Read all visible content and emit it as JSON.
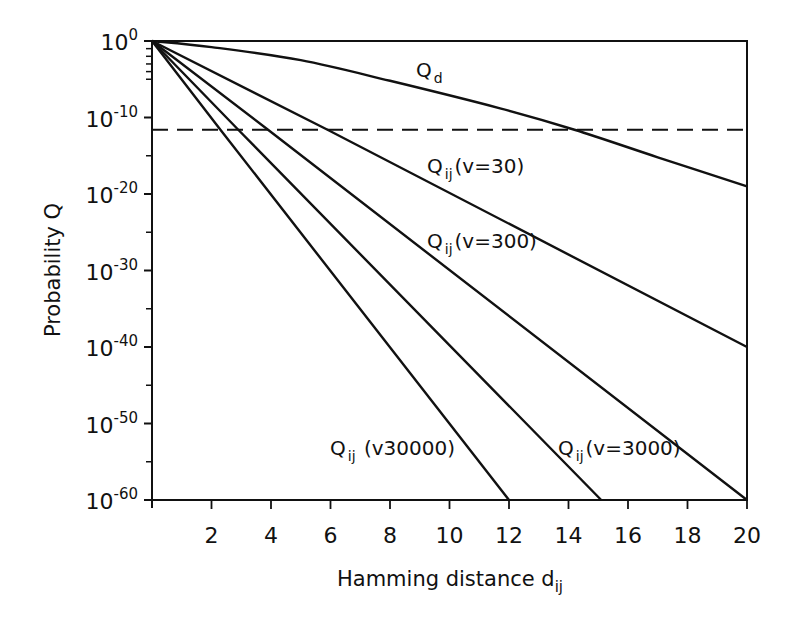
{
  "chart_data": {
    "type": "line",
    "title": "",
    "xlabel": "Hamming distance d_ij",
    "xlabel_main": "Hamming  distance  d",
    "xlabel_sub": "ij",
    "ylabel": "Probability  Q",
    "x_scale": "linear",
    "y_scale": "log",
    "xlim": [
      0,
      20
    ],
    "ylim_exponent": [
      -60,
      0
    ],
    "x_ticks": [
      2,
      4,
      6,
      8,
      10,
      12,
      14,
      16,
      18,
      20
    ],
    "y_ticks": [
      {
        "exp": 0,
        "label_base": "10",
        "label_exp": "0"
      },
      {
        "exp": -10,
        "label_base": "10",
        "label_exp": "-10"
      },
      {
        "exp": -20,
        "label_base": "10",
        "label_exp": "-20"
      },
      {
        "exp": -30,
        "label_base": "10",
        "label_exp": "-30"
      },
      {
        "exp": -40,
        "label_base": "10",
        "label_exp": "-40"
      },
      {
        "exp": -50,
        "label_base": "10",
        "label_exp": "-50"
      },
      {
        "exp": -60,
        "label_base": "10",
        "label_exp": "-60"
      }
    ],
    "y_minor_ticks_exp": [
      -1,
      -2,
      -3,
      -4,
      -5,
      -15,
      -25,
      -35,
      -45,
      -55
    ],
    "grid": false,
    "legend": "inline labels",
    "threshold_line": {
      "style": "dashed",
      "y_exponent": -11.6
    },
    "series": [
      {
        "name": "Q_d",
        "label_main": "Q",
        "label_sub": "d",
        "label_rest": "",
        "points": [
          [
            0,
            0
          ],
          [
            2,
            -0.8
          ],
          [
            5,
            -2.5
          ],
          [
            8,
            -5.2
          ],
          [
            11.7,
            -8.8
          ],
          [
            14.2,
            -11.6
          ],
          [
            17,
            -15.2
          ],
          [
            20,
            -19
          ]
        ]
      },
      {
        "name": "Q_ij (v=30)",
        "label_main": "Q",
        "label_sub": "ij",
        "label_rest": "(v=30)",
        "points": [
          [
            0,
            0
          ],
          [
            5.9,
            -11.6
          ],
          [
            20,
            -40
          ]
        ]
      },
      {
        "name": "Q_ij (v=300)",
        "label_main": "Q",
        "label_sub": "ij",
        "label_rest": "(v=300)",
        "points": [
          [
            0,
            0
          ],
          [
            3.9,
            -11.6
          ],
          [
            20,
            -60
          ]
        ]
      },
      {
        "name": "Q_ij (v=3000)",
        "label_main": "Q",
        "label_sub": "ij",
        "label_rest": "(v=3000)",
        "points": [
          [
            0,
            0
          ],
          [
            2.9,
            -11.6
          ],
          [
            15.1,
            -60
          ]
        ]
      },
      {
        "name": "Q_ij (v30000)",
        "label_main": "Q",
        "label_sub": "ij",
        "label_rest": " (v30000)",
        "points": [
          [
            0,
            0
          ],
          [
            2.3,
            -11.6
          ],
          [
            12,
            -60
          ]
        ]
      }
    ]
  },
  "label_positions": [
    {
      "x": 416,
      "y": 77
    },
    {
      "x": 427,
      "y": 173
    },
    {
      "x": 427,
      "y": 248
    },
    {
      "x": 558,
      "y": 455
    },
    {
      "x": 330,
      "y": 455
    }
  ]
}
